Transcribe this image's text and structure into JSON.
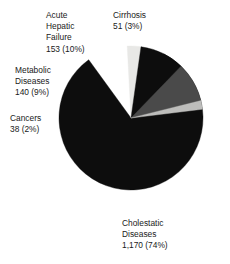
{
  "chart_data": {
    "type": "pie",
    "title": "",
    "total": 1552,
    "categories": [
      "Cholestatic Diseases",
      "Acute Hepatic Failure",
      "Metabolic Diseases",
      "Cirrhosis",
      "Cancers"
    ],
    "values": [
      1170,
      153,
      140,
      51,
      38
    ],
    "percents": [
      74,
      10,
      9,
      3,
      2
    ],
    "value_labels": [
      "1,170 (74%)",
      "153 (10%)",
      "140 (9%)",
      "51 (3%)",
      "38 (2%)"
    ],
    "colors": [
      "#0d0d0d",
      "#0d0d0d",
      "#4a4a4a",
      "#e8e8e6",
      "#bdbdbb"
    ],
    "legend": "none",
    "grid": false,
    "labels_placement": "outside"
  },
  "slices": {
    "cholestatic": {
      "name_line1": "Cholestatic",
      "name_line2": "Diseases",
      "value_label": "1,170 (74%)",
      "value": 1170,
      "percent": 74,
      "color": "#0d0d0d",
      "start_angle": -63,
      "end_angle": 234
    },
    "acute_hepatic_failure": {
      "name_line1": "Acute",
      "name_line2": "Hepatic",
      "name_line3": "Failure",
      "value_label": "153 (10%)",
      "value": 153,
      "percent": 10,
      "color": "#0d0d0d",
      "start_angle": 278,
      "end_angle": 314
    },
    "metabolic": {
      "name_line1": "Metabolic",
      "name_line2": "Diseases",
      "value_label": "140 (9%)",
      "value": 140,
      "percent": 9,
      "color": "#4a4a4a",
      "start_angle": 314,
      "end_angle": 346
    },
    "cirrhosis": {
      "name_line1": "Cirrhosis",
      "value_label": "51 (3%)",
      "value": 51,
      "percent": 3,
      "color": "#e8e8e6",
      "start_angle": 267,
      "end_angle": 278
    },
    "cancers": {
      "name_line1": "Cancers",
      "value_label": "38 (2%)",
      "value": 38,
      "percent": 2,
      "color": "#bdbdbb",
      "start_angle": 346,
      "end_angle": 353
    }
  },
  "geometry": {
    "cx": 131,
    "cy": 118,
    "r": 72
  }
}
